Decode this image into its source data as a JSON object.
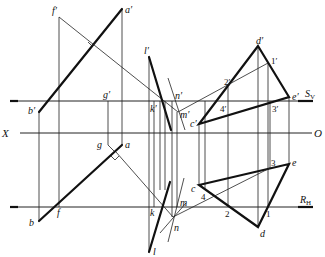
{
  "axis": {
    "x_label": "X",
    "o_label": "O",
    "sv_label": "S",
    "sv_sub": "V",
    "rh_label": "R",
    "rh_sub": "H"
  },
  "labels": {
    "f_prime": "f′",
    "a_prime": "a′",
    "b_prime": "b′",
    "g_prime": "g′",
    "f": "f",
    "b": "b",
    "g": "g",
    "a": "a",
    "l_prime": "l′",
    "k_prime": "k′",
    "n_prime": "n′",
    "m_prime": "m′",
    "k": "k",
    "l": "l",
    "m": "m",
    "n": "n",
    "d_prime": "d′",
    "one_prime": "1′",
    "two_prime": "2′",
    "four_prime": "4′",
    "three_prime": "3′",
    "e_prime": "e′",
    "c_prime": "c′",
    "c": "c",
    "four": "4",
    "two": "2",
    "d": "d",
    "one": "1",
    "three": "3",
    "e": "e"
  }
}
